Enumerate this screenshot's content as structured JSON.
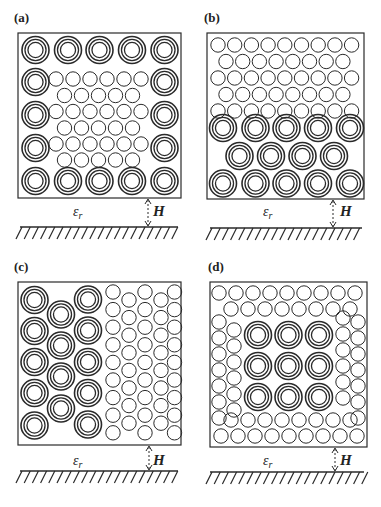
{
  "figure": {
    "panels": [
      {
        "id": "a",
        "label": "(a)",
        "description": "Multi-walled CNT bundles around perimeter, single-walled CNTs in center",
        "box": {
          "x": 18,
          "y": 33,
          "w": 163,
          "h": 165
        },
        "substrate_label": "εr",
        "height_label": "H"
      },
      {
        "id": "b",
        "label": "(b)",
        "description": "Single-walled CNTs on top rows, multi-walled CNTs in bottom three rows",
        "box": {
          "x": 207,
          "y": 33,
          "w": 157,
          "h": 166
        },
        "substrate_label": "εr",
        "height_label": "H"
      },
      {
        "id": "c",
        "label": "(c)",
        "description": "Multi-walled CNTs on left half, single-walled CNTs on right half",
        "box": {
          "x": 18,
          "y": 282,
          "w": 163,
          "h": 163
        },
        "substrate_label": "εr",
        "height_label": "H"
      },
      {
        "id": "d",
        "label": "(d)",
        "description": "Single-walled CNTs around perimeter, 3x3 multi-walled CNTs in center",
        "box": {
          "x": 210,
          "y": 282,
          "w": 157,
          "h": 165
        },
        "substrate_label": "εr",
        "height_label": "H"
      }
    ],
    "colors": {
      "stroke": "#2a2a2a",
      "background": "#ffffff"
    }
  }
}
